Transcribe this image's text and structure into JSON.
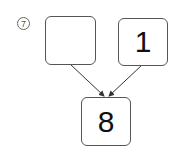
{
  "problem_number": "7",
  "boxes": {
    "top_left": "",
    "top_right": "1",
    "bottom": "8"
  }
}
